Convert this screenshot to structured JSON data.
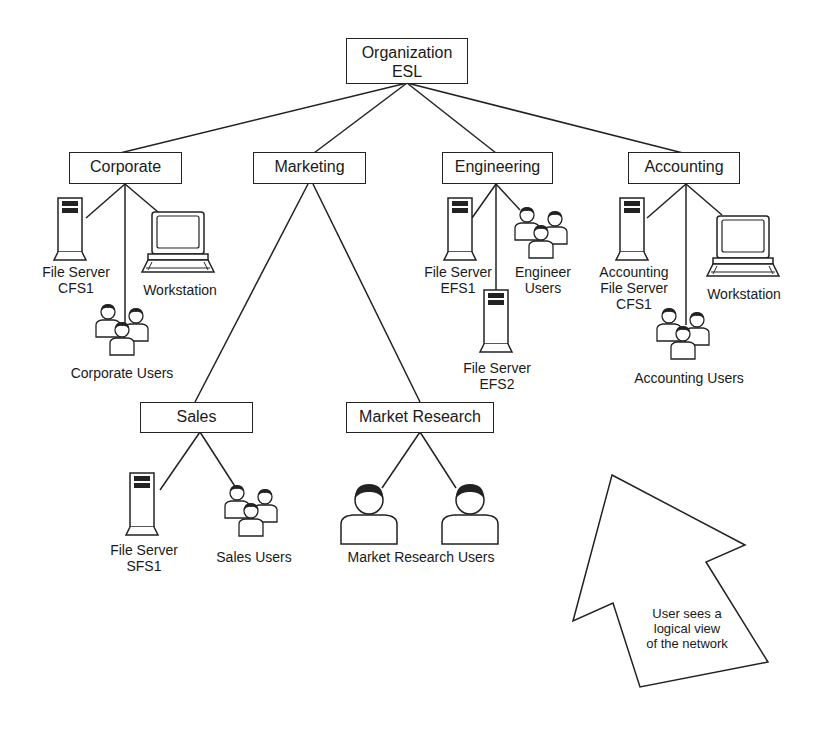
{
  "root": {
    "line1": "Organization",
    "line2": "ESL"
  },
  "departments": {
    "corporate": {
      "label": "Corporate",
      "server": {
        "line1": "File Server",
        "line2": "CFS1"
      },
      "workstation": "Workstation",
      "users": "Corporate Users"
    },
    "marketing": {
      "label": "Marketing",
      "sales": {
        "label": "Sales",
        "server": {
          "line1": "File Server",
          "line2": "SFS1"
        },
        "users": "Sales Users"
      },
      "market_research": {
        "label": "Market Research",
        "users": "Market Research Users"
      }
    },
    "engineering": {
      "label": "Engineering",
      "server1": {
        "line1": "File Server",
        "line2": "EFS1"
      },
      "server2": {
        "line1": "File Server",
        "line2": "EFS2"
      },
      "users": {
        "line1": "Engineer",
        "line2": "Users"
      }
    },
    "accounting": {
      "label": "Accounting",
      "server": {
        "line1": "Accounting",
        "line2": "File Server",
        "line3": "CFS1"
      },
      "workstation": "Workstation",
      "users": "Accounting Users"
    }
  },
  "callout": {
    "line1": "User sees a",
    "line2": "logical view",
    "line3": "of the network"
  }
}
